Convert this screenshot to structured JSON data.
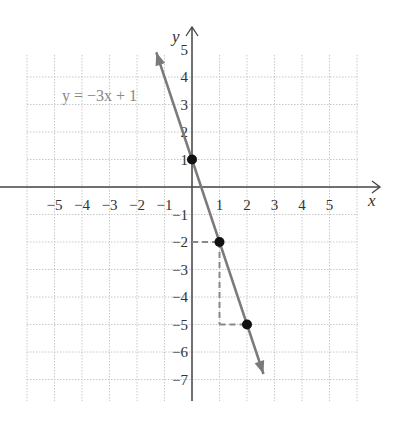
{
  "chart_data": {
    "type": "line",
    "title": "",
    "equation_label": "y = −3x + 1",
    "xlabel": "x",
    "ylabel": "y",
    "xlim": [
      -6,
      6
    ],
    "ylim": [
      -8,
      5
    ],
    "grid": true,
    "x_ticks": [
      -5,
      -4,
      -3,
      -2,
      -1,
      1,
      2,
      3,
      4,
      5
    ],
    "y_ticks": [
      5,
      4,
      3,
      2,
      1,
      -1,
      -2,
      -3,
      -4,
      -5,
      -6,
      -7
    ],
    "line": {
      "slope": -3,
      "intercept": 1,
      "x_range": [
        -1.3,
        2.6
      ]
    },
    "points": [
      {
        "x": 0,
        "y": 1
      },
      {
        "x": 1,
        "y": -2
      },
      {
        "x": 2,
        "y": -5
      }
    ],
    "slope_guides": [
      {
        "from": [
          0,
          -2
        ],
        "to": [
          1,
          -2
        ]
      },
      {
        "from": [
          1,
          -2
        ],
        "to": [
          1,
          -5
        ]
      },
      {
        "from": [
          1,
          -5
        ],
        "to": [
          2,
          -5
        ]
      }
    ],
    "colors": {
      "line": "#7a7a7a",
      "axis": "#444444",
      "grid": "#c8c8c8",
      "point": "#111111",
      "guide": "#888888"
    }
  }
}
